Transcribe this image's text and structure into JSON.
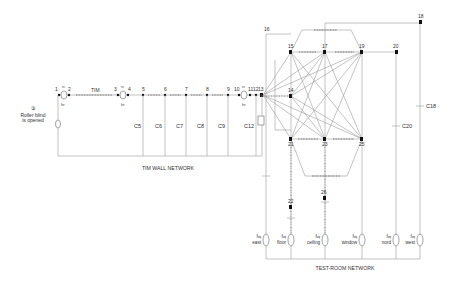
{
  "diagram": {
    "type": "thermal-network",
    "sections": {
      "tim_wall": "TIM WALL NETWORK",
      "test_room": "TEST-ROOM NETWORK"
    },
    "annotations": {
      "roller_number": "③",
      "roller_line1": "Roller blind",
      "roller_line2": "is opened"
    },
    "wall_nodes": [
      "1",
      "2",
      "3",
      "4",
      "5",
      "6",
      "7",
      "8",
      "9",
      "10",
      "11",
      "12",
      "13"
    ],
    "wall_labels": {
      "rc1": "rc",
      "hr1": "hr",
      "tim": "TIM",
      "rc2": "rc",
      "hr2": "hr",
      "rc3": "rc",
      "hr3": "hr"
    },
    "wall_capacitors": [
      "C5",
      "C6",
      "C7",
      "C8",
      "C9",
      "C12"
    ],
    "room_nodes": [
      "14",
      "15",
      "16",
      "17",
      "18",
      "19",
      "20",
      "21",
      "22",
      "23",
      "24",
      "25",
      "26"
    ],
    "room_capacitors": [
      "C18",
      "C20"
    ],
    "sources": [
      {
        "sym": "f",
        "sub": "eq",
        "label": "east"
      },
      {
        "sym": "f",
        "sub": "eq",
        "label": "floor"
      },
      {
        "sym": "f",
        "sub": "eq",
        "label": "ceiling"
      },
      {
        "sym": "f",
        "sub": "eq",
        "label": "window"
      },
      {
        "sym": "f",
        "sub": "eq",
        "label": "nord"
      },
      {
        "sym": "f",
        "sub": "eq",
        "label": "west"
      }
    ]
  }
}
